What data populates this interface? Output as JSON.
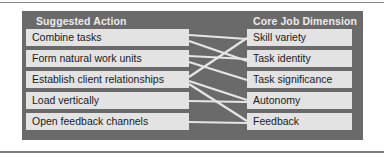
{
  "diagram": {
    "left_header": "Suggested Action",
    "right_header": "Core Job Dimension",
    "actions": [
      {
        "label": "Combine tasks"
      },
      {
        "label": "Form natural work units"
      },
      {
        "label": "Establish client relationships"
      },
      {
        "label": "Load vertically"
      },
      {
        "label": "Open feedback channels"
      }
    ],
    "dimensions": [
      {
        "label": "Skill variety"
      },
      {
        "label": "Task identity"
      },
      {
        "label": "Task significance"
      },
      {
        "label": "Autonomy"
      },
      {
        "label": "Feedback"
      }
    ],
    "links": [
      {
        "from": "Combine tasks",
        "to": "Skill variety"
      },
      {
        "from": "Combine tasks",
        "to": "Task identity"
      },
      {
        "from": "Form natural work units",
        "to": "Task identity"
      },
      {
        "from": "Form natural work units",
        "to": "Task significance"
      },
      {
        "from": "Establish client relationships",
        "to": "Skill variety"
      },
      {
        "from": "Establish client relationships",
        "to": "Autonomy"
      },
      {
        "from": "Establish client relationships",
        "to": "Feedback"
      },
      {
        "from": "Load vertically",
        "to": "Autonomy"
      },
      {
        "from": "Open feedback channels",
        "to": "Feedback"
      }
    ],
    "colors": {
      "panel": "#6a6a6a",
      "box": "#e3e3e3",
      "header_text": "#ececec",
      "line": "#e6e6e6"
    }
  }
}
